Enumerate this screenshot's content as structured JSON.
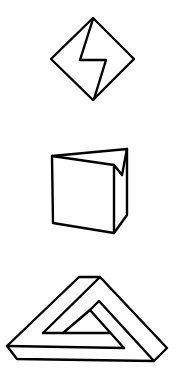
{
  "figures": [
    {
      "id": "diamond-lightning",
      "label": "Diamond with zigzag bolt"
    },
    {
      "id": "folded-cube",
      "label": "Cube with folded corner"
    },
    {
      "id": "impossible-triangle",
      "label": "Impossible triangle"
    }
  ],
  "colors": {
    "stroke": "#000000",
    "background": "#ffffff"
  }
}
